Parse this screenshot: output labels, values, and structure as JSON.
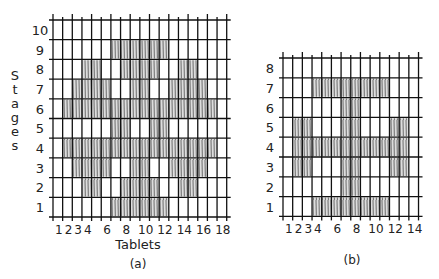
{
  "figure_a": {
    "caption": "(a)",
    "x_axis_title": "Tablets",
    "y_axis_title": "Stages",
    "columns": 18,
    "rows": 10,
    "x_tick_labels": [
      {
        "col": 1,
        "text": "1"
      },
      {
        "col": 2,
        "text": "2"
      },
      {
        "col": 3,
        "text": "3"
      },
      {
        "col": 4,
        "text": "4"
      },
      {
        "col": 6,
        "text": "6"
      },
      {
        "col": 8,
        "text": "8"
      },
      {
        "col": 10,
        "text": "10"
      },
      {
        "col": 12,
        "text": "12"
      },
      {
        "col": 14,
        "text": "14"
      },
      {
        "col": 16,
        "text": "16"
      },
      {
        "col": 18,
        "text": "18"
      }
    ],
    "y_tick_labels": [
      "1",
      "2",
      "3",
      "4",
      "5",
      "6",
      "7",
      "8",
      "9",
      "10"
    ],
    "shaded": {
      "10": [],
      "9": [
        [
          7,
          12
        ]
      ],
      "8": [
        [
          4,
          5
        ],
        [
          8,
          11
        ],
        [
          14,
          15
        ]
      ],
      "7": [
        [
          3,
          6
        ],
        [
          9,
          10
        ],
        [
          13,
          16
        ]
      ],
      "6": [
        [
          2,
          17
        ]
      ],
      "5": [
        [
          7,
          8
        ],
        [
          11,
          12
        ]
      ],
      "4": [
        [
          2,
          17
        ]
      ],
      "3": [
        [
          3,
          6
        ],
        [
          9,
          10
        ],
        [
          13,
          16
        ]
      ],
      "2": [
        [
          4,
          5
        ],
        [
          8,
          11
        ],
        [
          14,
          15
        ]
      ],
      "1": [
        [
          7,
          12
        ]
      ]
    }
  },
  "figure_b": {
    "caption": "(b)",
    "columns": 14,
    "rows": 8,
    "x_tick_labels": [
      {
        "col": 1,
        "text": "1"
      },
      {
        "col": 2,
        "text": "2"
      },
      {
        "col": 3,
        "text": "3"
      },
      {
        "col": 4,
        "text": "4"
      },
      {
        "col": 6,
        "text": "6"
      },
      {
        "col": 8,
        "text": "8"
      },
      {
        "col": 10,
        "text": "10"
      },
      {
        "col": 12,
        "text": "12"
      },
      {
        "col": 14,
        "text": "14"
      }
    ],
    "y_tick_labels": [
      "1",
      "2",
      "3",
      "4",
      "5",
      "6",
      "7",
      "8"
    ],
    "shaded": {
      "8": [],
      "7": [
        [
          4,
          11
        ]
      ],
      "6": [
        [
          7,
          8
        ]
      ],
      "5": [
        [
          2,
          3
        ],
        [
          7,
          8
        ],
        [
          12,
          13
        ]
      ],
      "4": [
        [
          2,
          13
        ]
      ],
      "3": [
        [
          2,
          3
        ],
        [
          7,
          8
        ],
        [
          12,
          13
        ]
      ],
      "2": [
        [
          7,
          8
        ]
      ],
      "1": [
        [
          4,
          11
        ]
      ]
    }
  },
  "colors": {
    "grid_line": "#111111",
    "hatch": "#555555",
    "hatch_bg": "#d8d8d8",
    "text": "#222222"
  }
}
